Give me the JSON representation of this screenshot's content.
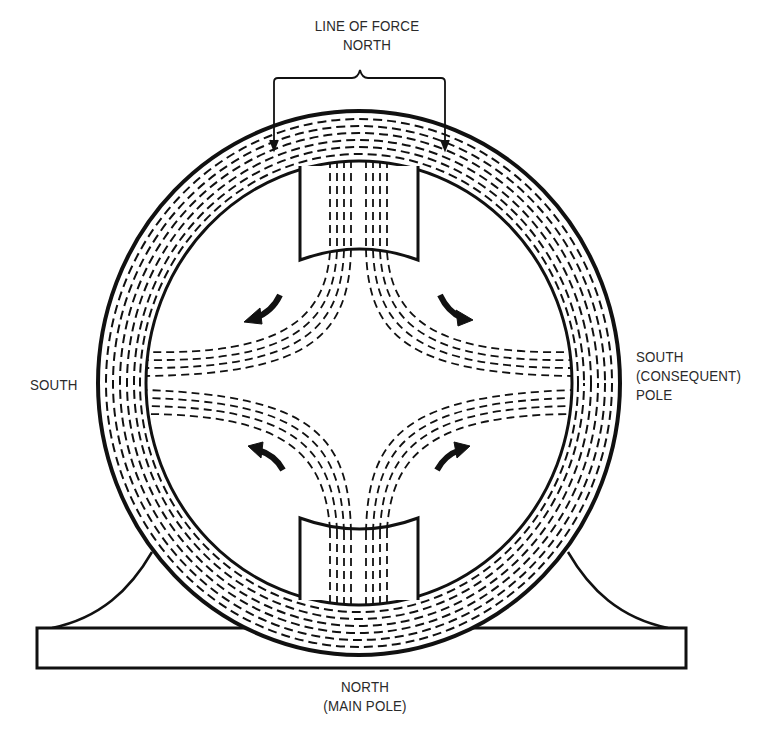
{
  "labels": {
    "top_line1": "LINE OF FORCE",
    "top_line2": "NORTH",
    "left": "SOUTH",
    "right_line1": "SOUTH",
    "right_line2": "(CONSEQUENT)",
    "right_line3": "POLE",
    "bottom_line1": "NORTH",
    "bottom_line2": "(MAIN POLE)"
  },
  "components": [
    {
      "name": "frame-ring",
      "description": "Circular yoke carrying dashed flux lines"
    },
    {
      "name": "north-pole-top",
      "description": "Pole piece at top (NORTH)"
    },
    {
      "name": "north-pole-bottom",
      "description": "Main pole piece at bottom (NORTH, MAIN POLE)"
    },
    {
      "name": "base",
      "description": "Mounting base with two curved feet"
    },
    {
      "name": "flux-arrows",
      "description": "Four curved arrows showing flux direction toward consequent poles"
    }
  ],
  "colors": {
    "ink": "#111111",
    "text": "#2a2a2a",
    "background": "#ffffff"
  }
}
